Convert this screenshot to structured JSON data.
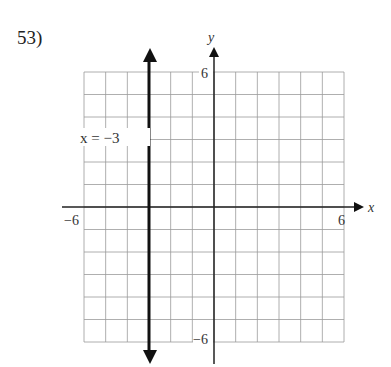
{
  "problem": {
    "number": "53)"
  },
  "chart_data": {
    "type": "line",
    "title": "",
    "xlabel": "x",
    "ylabel": "y",
    "xlim": [
      -6,
      6
    ],
    "ylim": [
      -6,
      6
    ],
    "grid": true,
    "grid_step": 1,
    "tick_labels": {
      "x_min": "−6",
      "x_max": "6",
      "y_max": "6",
      "y_min": "−6"
    },
    "series": [
      {
        "name": "x = −3",
        "kind": "vertical_line",
        "x": -3,
        "points": [
          [
            -3,
            -6
          ],
          [
            -3,
            6
          ]
        ],
        "arrows": "both"
      }
    ],
    "annotations": [
      {
        "text": "x = −3",
        "x": -3,
        "y": 3
      }
    ]
  },
  "labels": {
    "x_axis": "x",
    "y_axis": "y",
    "x_min": "−6",
    "x_max": "6",
    "y_max": "6",
    "y_min": "−6",
    "equation": "x = −3"
  }
}
